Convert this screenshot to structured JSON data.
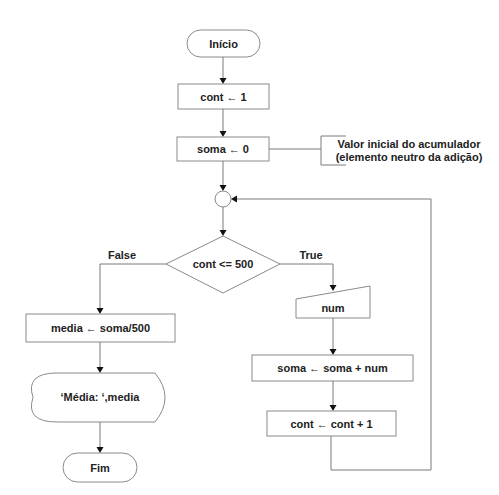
{
  "diagram": {
    "type": "flowchart",
    "nodes": {
      "start": {
        "shape": "terminator",
        "label": "Início"
      },
      "init_cont": {
        "shape": "process",
        "label": "cont ← 1"
      },
      "init_soma": {
        "shape": "process",
        "label": "soma ← 0"
      },
      "connector": {
        "shape": "connector",
        "label": ""
      },
      "decision": {
        "shape": "decision",
        "label": "cont <= 500"
      },
      "calc_media": {
        "shape": "process",
        "label": "media ← soma/500"
      },
      "display": {
        "shape": "display",
        "label": "‘Média: ‘,media"
      },
      "end": {
        "shape": "terminator",
        "label": "Fim"
      },
      "input_num": {
        "shape": "manual-input",
        "label": "num"
      },
      "acc_soma": {
        "shape": "process",
        "label": "soma ← soma + num"
      },
      "inc_cont": {
        "shape": "process",
        "label": "cont ← cont + 1"
      }
    },
    "annotation": {
      "line1": "Valor inicial do acumulador",
      "line2": "(elemento neutro da adição)"
    },
    "branches": {
      "false_label": "False",
      "true_label": "True"
    },
    "colors": {
      "stroke": "#8a8a8a",
      "text": "#222222",
      "arrow": "#111111",
      "background": "#ffffff"
    }
  }
}
